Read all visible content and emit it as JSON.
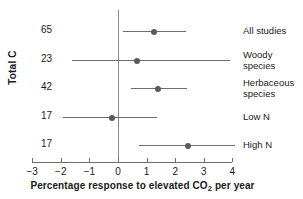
{
  "chart_data": {
    "type": "scatter",
    "subtype": "dot-and-whisker forest plot",
    "title": "",
    "xlabel_pre": "Percentage response to elevated CO",
    "xlabel_sub": "2",
    "xlabel_post": " per year",
    "xlabel_full": "Percentage response to elevated CO2 per year",
    "ylabel": "Total C",
    "xlim": [
      -3,
      4
    ],
    "xticks": [
      -3,
      -2,
      -1,
      0,
      1,
      2,
      3,
      4
    ],
    "xticklabels": [
      "−3",
      "−2",
      "−1",
      "0",
      "1",
      "2",
      "3",
      "4"
    ],
    "grid": false,
    "legend": false,
    "zero_reference_line": 0,
    "categories": [
      "All studies",
      "Woody species",
      "Herbaceous species",
      "Low N",
      "High N"
    ],
    "n_label_header": "Total C",
    "n_values": [
      65,
      23,
      42,
      17,
      17
    ],
    "values": [
      1.27,
      0.68,
      1.39,
      -0.2,
      2.45
    ],
    "ci_low": [
      0.16,
      -1.62,
      0.46,
      -1.94,
      0.74
    ],
    "ci_high": [
      2.39,
      3.93,
      2.41,
      1.36,
      4.1
    ],
    "points": [
      {
        "label": "All studies",
        "label_lines": "All studies",
        "n": 65,
        "value": 1.27,
        "ci_low": 0.16,
        "ci_high": 2.39
      },
      {
        "label": "Woody species",
        "label_lines": "Woody\nspecies",
        "n": 23,
        "value": 0.68,
        "ci_low": -1.62,
        "ci_high": 3.93
      },
      {
        "label": "Herbaceous species",
        "label_lines": "Herbaceous\nspecies",
        "n": 42,
        "value": 1.39,
        "ci_low": 0.46,
        "ci_high": 2.41
      },
      {
        "label": "Low N",
        "label_lines": "Low N",
        "n": 17,
        "value": -0.2,
        "ci_low": -1.94,
        "ci_high": 1.36
      },
      {
        "label": "High N",
        "label_lines": "High N",
        "n": 17,
        "value": 2.45,
        "ci_low": 0.74,
        "ci_high": 4.1
      }
    ],
    "colors": {
      "background": "#ffffff",
      "marker": "#5a5a5a",
      "line": "#6e6e6e",
      "axis": "#6e6e6e",
      "text": "#1a1a1a"
    }
  }
}
